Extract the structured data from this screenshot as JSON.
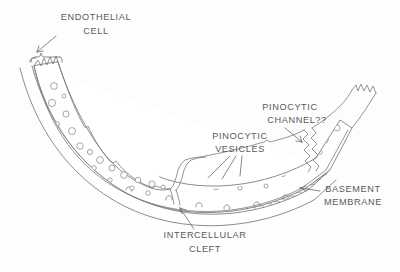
{
  "figure": {
    "kind": "scientific-line-drawing",
    "background_color": "#fdfdfd",
    "ink_color": "#6a6a6c",
    "label_color": "#5a5a5c"
  },
  "labels": [
    {
      "id": "endothelial-cell",
      "lines": [
        "ENDOTHELIAL",
        "CELL"
      ],
      "line1": "ENDOTHELIAL",
      "line2": "CELL",
      "x": 96,
      "y1": 18,
      "y2": 32,
      "leader": "arrow-down-left-to-brace"
    },
    {
      "id": "pinocytic-channel",
      "lines": [
        "PINOCYTIC",
        "CHANNEL??"
      ],
      "line1": "PINOCYTIC",
      "line2": "CHANNEL??",
      "x": 290,
      "y1": 108,
      "y2": 121,
      "leader": "arrow-down-right"
    },
    {
      "id": "pinocytic-vesicles",
      "lines": [
        "PINOCYTIC",
        "VESICLES"
      ],
      "line1": "PINOCYTIC",
      "line2": "VESICLES",
      "x": 240,
      "y1": 137,
      "y2": 150,
      "leader": "three-fan-lines-down"
    },
    {
      "id": "basement-membrane",
      "lines": [
        "BASEMENT",
        "MEMBRANE"
      ],
      "line1": "BASEMENT",
      "line2": "MEMBRANE",
      "x": 353,
      "y1": 190,
      "y2": 203,
      "leader": "arrow-left"
    },
    {
      "id": "intercellular-cleft",
      "lines": [
        "INTERCELLULAR",
        "CLEFT"
      ],
      "line1": "INTERCELLULAR",
      "line2": "CLEFT",
      "x": 205,
      "y1": 236,
      "y2": 250,
      "leader": "arrow-up"
    }
  ],
  "structures": {
    "endothelium": "curved band forming a shallow U from upper-left to upper-right",
    "basement_membrane": "dense cross-hatched band along the outer (lower) surface",
    "vesicle_count_visible": 46,
    "clefts": [
      "center cleft below intercellular-cleft label",
      "right cleft at pinocytic-channel label"
    ],
    "cell_ends": [
      "left zigzag torn edge",
      "right zigzag torn edge"
    ]
  }
}
